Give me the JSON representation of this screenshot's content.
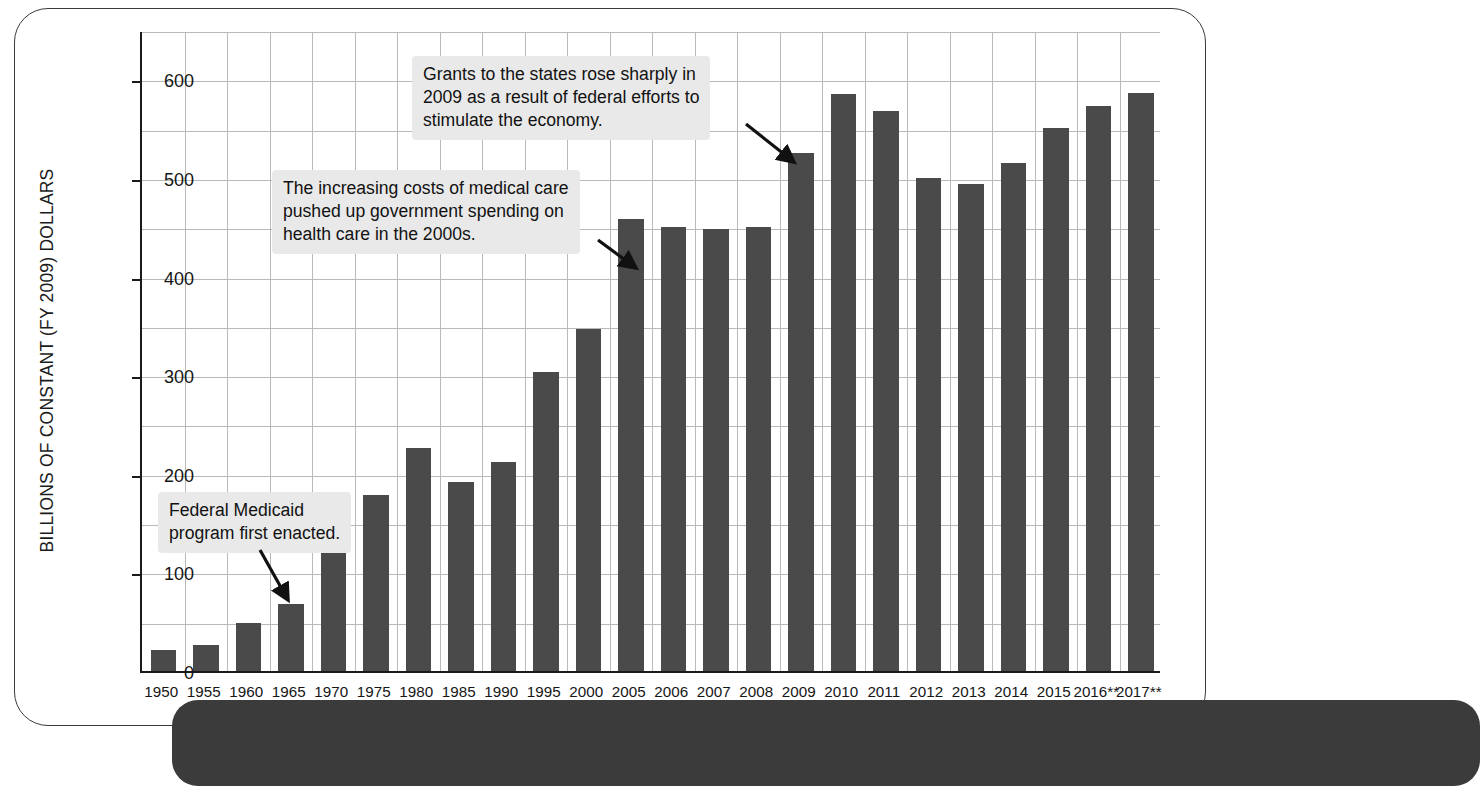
{
  "chart_data": {
    "type": "bar",
    "title": "",
    "subtitle": "",
    "xlabel": "",
    "ylabel": "BILLIONS OF CONSTANT (FY 2009) DOLLARS",
    "ylim": [
      0,
      650
    ],
    "yticks": [
      0,
      100,
      200,
      300,
      400,
      500,
      600
    ],
    "ytick_labels": [
      "0",
      "100",
      "200",
      "300",
      "400",
      "500",
      "600"
    ],
    "gridline_step": 50,
    "grid": "both",
    "legend": "none",
    "bar_color": "#4a4a4a",
    "categories": [
      "1950",
      "1955",
      "1960",
      "1965",
      "1970",
      "1975",
      "1980",
      "1985",
      "1990",
      "1995",
      "2000",
      "2005",
      "2006",
      "2007",
      "2008",
      "2009",
      "2010",
      "2011",
      "2012",
      "2013",
      "2014",
      "2015",
      "2016**",
      "2017**"
    ],
    "values": [
      21,
      26,
      49,
      68,
      124,
      178,
      226,
      192,
      212,
      303,
      347,
      458,
      450,
      448,
      450,
      525,
      585,
      568,
      500,
      494,
      515,
      551,
      573,
      586
    ],
    "annotations": [
      {
        "id": "grants-2009",
        "text": "Grants to the states rose sharply in\n2009 as a result of federal efforts to\nstimulate the economy.",
        "points_to": "2009"
      },
      {
        "id": "medical-costs-2000s",
        "text": "The increasing costs of medical care\npushed up government spending on\nhealth care in the 2000s.",
        "points_to": "2005"
      },
      {
        "id": "medicaid-enacted",
        "text": "Federal Medicaid\nprogram first enacted.",
        "points_to": "1965"
      }
    ]
  }
}
